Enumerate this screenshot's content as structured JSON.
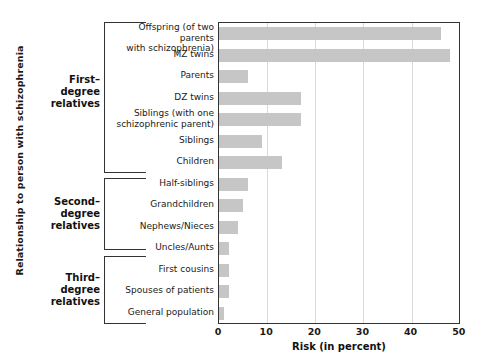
{
  "chart_data": {
    "type": "bar",
    "orientation": "horizontal",
    "title": "",
    "xlabel": "Risk (in percent)",
    "ylabel": "Relationship to person with schizophrenia",
    "xlim": [
      0,
      50
    ],
    "xticks": [
      0,
      10,
      20,
      30,
      40,
      50
    ],
    "grid": true,
    "legend": null,
    "bar_color": "#c6c6c6",
    "categories": [
      "Offspring (of two parents\nwith schizophrenia)",
      "MZ twins",
      "Parents",
      "DZ twins",
      "Siblings (with one\nschizophrenic parent)",
      "Siblings",
      "Children",
      "Half-siblings",
      "Grandchildren",
      "Nephews/Nieces",
      "Uncles/Aunts",
      "First cousins",
      "Spouses of patients",
      "General population"
    ],
    "values": [
      46,
      48,
      6,
      17,
      17,
      9,
      13,
      6,
      5,
      4,
      2,
      2,
      2,
      1
    ],
    "groups": [
      {
        "label": "First–\ndegree\nrelatives",
        "categories": 7
      },
      {
        "label": "Second–\ndegree\nrelatives",
        "categories": 4
      },
      {
        "label": "Third–\ndegree\nrelatives",
        "categories": 3
      }
    ]
  }
}
